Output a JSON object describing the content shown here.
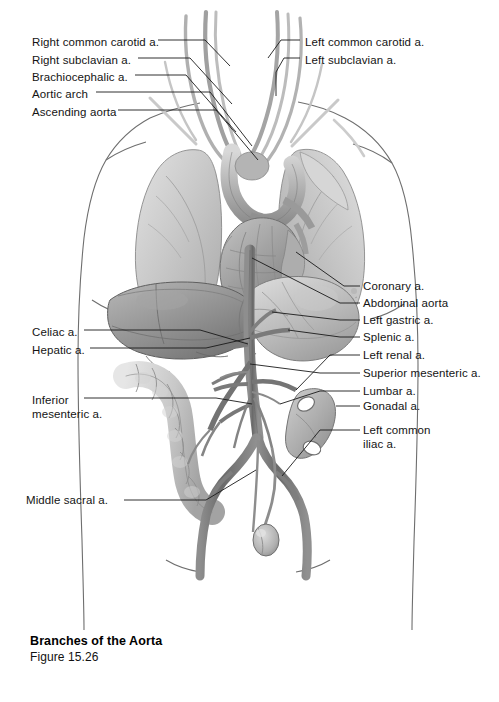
{
  "figure": {
    "title": "Branches of the Aorta",
    "number": "Figure 15.26",
    "style": "grayscale medical illustration",
    "background_color": "#ffffff",
    "label_color": "#141414",
    "leader_line_color": "#1a1a1a"
  },
  "labels_left": [
    {
      "id": "right-common-carotid",
      "text": "Right common carotid a.",
      "x": 32,
      "y": 36
    },
    {
      "id": "right-subclavian",
      "text": "Right subclavian a.",
      "x": 32,
      "y": 54
    },
    {
      "id": "brachiocephalic",
      "text": "Brachiocephalic a.",
      "x": 32,
      "y": 71
    },
    {
      "id": "aortic-arch",
      "text": "Aortic arch",
      "x": 32,
      "y": 88
    },
    {
      "id": "ascending-aorta",
      "text": "Ascending aorta",
      "x": 32,
      "y": 106
    },
    {
      "id": "celiac",
      "text": "Celiac a.",
      "x": 32,
      "y": 326
    },
    {
      "id": "hepatic",
      "text": "Hepatic a.",
      "x": 32,
      "y": 344
    },
    {
      "id": "inferior-mesenteric",
      "text": "Inferior\nmesenteric a.",
      "x": 32,
      "y": 394
    },
    {
      "id": "middle-sacral",
      "text": "Middle sacral a.",
      "x": 26,
      "y": 496
    }
  ],
  "labels_right": [
    {
      "id": "left-common-carotid",
      "text": "Left common carotid a.",
      "x": 305,
      "y": 36
    },
    {
      "id": "left-subclavian",
      "text": "Left subclavian a.",
      "x": 305,
      "y": 54
    },
    {
      "id": "coronary",
      "text": "Coronary a.",
      "x": 363,
      "y": 282
    },
    {
      "id": "abdominal-aorta",
      "text": "Abdominal aorta",
      "x": 363,
      "y": 299
    },
    {
      "id": "left-gastric",
      "text": "Left gastric a.",
      "x": 363,
      "y": 316
    },
    {
      "id": "splenic",
      "text": "Splenic a.",
      "x": 363,
      "y": 333
    },
    {
      "id": "left-renal",
      "text": "Left renal a.",
      "x": 363,
      "y": 351
    },
    {
      "id": "superior-mesenteric",
      "text": "Superior mesenteric a.",
      "x": 363,
      "y": 369
    },
    {
      "id": "lumbar",
      "text": "Lumbar a.",
      "x": 363,
      "y": 387
    },
    {
      "id": "gonadal",
      "text": "Gonadal a.",
      "x": 363,
      "y": 402
    },
    {
      "id": "left-common-iliac",
      "text": "Left common\niliac a.",
      "x": 363,
      "y": 425
    }
  ],
  "anatomy_parts": [
    {
      "id": "body-outline",
      "name": "torso outline"
    },
    {
      "id": "right-lung",
      "name": "right lung"
    },
    {
      "id": "left-lung",
      "name": "left lung"
    },
    {
      "id": "heart",
      "name": "heart"
    },
    {
      "id": "aortic-arch-vessel",
      "name": "aortic arch"
    },
    {
      "id": "liver",
      "name": "liver"
    },
    {
      "id": "stomach",
      "name": "stomach"
    },
    {
      "id": "descending-colon",
      "name": "descending colon"
    },
    {
      "id": "kidney",
      "name": "kidney"
    },
    {
      "id": "abdominal-aorta-vessel",
      "name": "abdominal aorta"
    },
    {
      "id": "iliac-arteries",
      "name": "common iliac arteries"
    },
    {
      "id": "gonad",
      "name": "testis"
    }
  ]
}
